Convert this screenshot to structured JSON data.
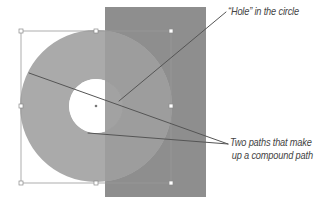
{
  "annotations": {
    "hole": "“Hole” in the circle",
    "paths_line1": "Two paths that make",
    "paths_line2": "up a compound path"
  },
  "colors": {
    "background": "#ffffff",
    "rectangle": "#8e8e8e",
    "ring": "#a9a9a9",
    "ring_over_rect": "#9c9c9c",
    "hole_fill": "#ffffff",
    "selection": "#9a9a9a",
    "leader_line": "#555555",
    "text": "#444444"
  },
  "shapes": {
    "rectangle": {
      "x": 105,
      "y": 7,
      "width": 101,
      "height": 190
    },
    "outer_circle": {
      "cx": 96,
      "cy": 106,
      "r": 76
    },
    "inner_hole": {
      "cx": 96,
      "cy": 106,
      "r": 27
    },
    "bounding_box": {
      "x": 21,
      "y": 31,
      "width": 150,
      "height": 152
    }
  }
}
